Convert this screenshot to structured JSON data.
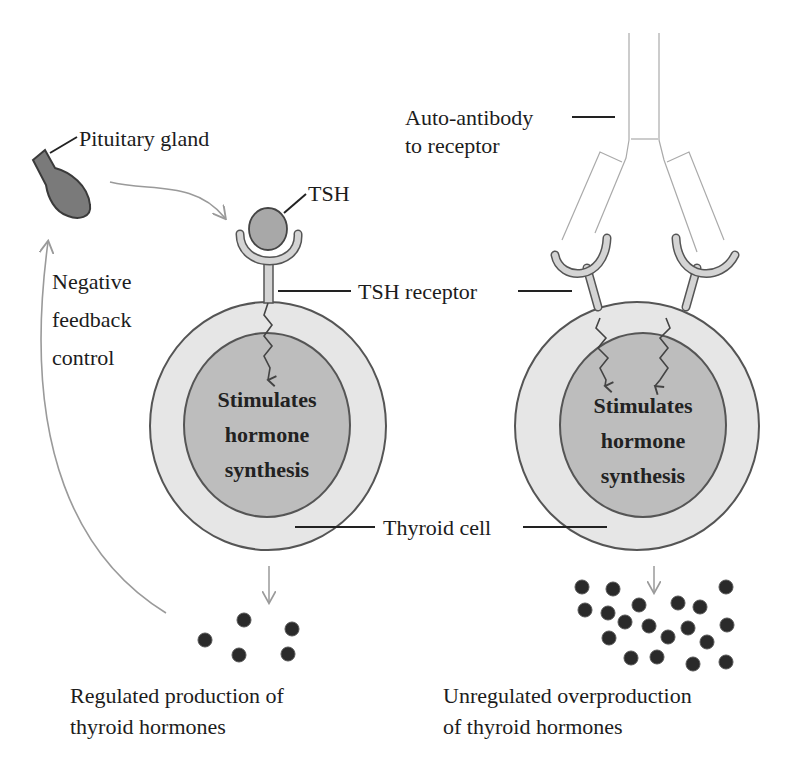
{
  "labels": {
    "pituitary_gland": "Pituitary gland",
    "tsh": "TSH",
    "auto_antibody_line1": "Auto-antibody",
    "auto_antibody_line2": "to receptor",
    "negative_feedback_line1": "Negative",
    "negative_feedback_line2": "feedback",
    "negative_feedback_line3": "control",
    "tsh_receptor": "TSH receptor",
    "thyroid_cell": "Thyroid cell"
  },
  "left_cell": {
    "inner_line1": "Stimulates",
    "inner_line2": "hormone",
    "inner_line3": "synthesis",
    "caption_line1": "Regulated production of",
    "caption_line2": "thyroid hormones",
    "hormone_count": 5
  },
  "right_cell": {
    "inner_line1": "Stimulates",
    "inner_line2": "hormone",
    "inner_line3": "synthesis",
    "caption_line1": "Unregulated overproduction",
    "caption_line2": "of thyroid hormones",
    "hormone_count": 19
  },
  "colors": {
    "outer_cell": "#e6e6e6",
    "inner_nucleus": "#bdbdbd",
    "gland": "#7a7a7a",
    "tsh": "#a8a8a8",
    "receptor": "#d4d4d4",
    "hormone": "#2a2a2a",
    "arrow": "#9a9a9a"
  }
}
